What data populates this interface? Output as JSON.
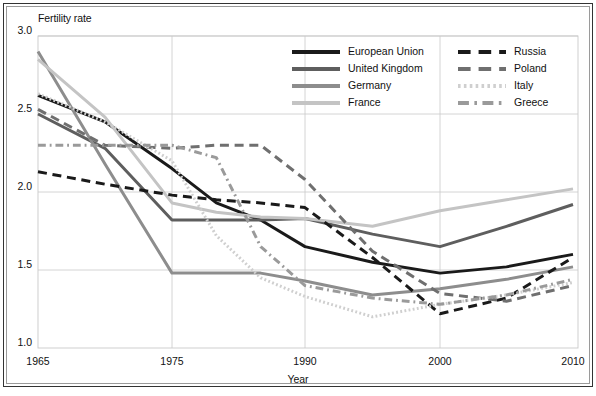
{
  "chart_data": {
    "type": "line",
    "title": "",
    "ylabel": "Fertility rate",
    "xlabel": "Year",
    "x": [
      1965,
      1970,
      1975,
      1980,
      1985,
      1990,
      1995,
      2000,
      2005,
      2010
    ],
    "xticks": [
      1965,
      1975,
      1990,
      2000,
      2010
    ],
    "xticklabels": [
      "1965",
      "1975",
      "1990",
      "2000",
      "2010"
    ],
    "xlim": [
      1965,
      2010
    ],
    "yticks": [
      1.0,
      1.5,
      2.0,
      2.5,
      3.0
    ],
    "yticklabels": [
      "1.0",
      "1.5",
      "2.0",
      "2.5",
      "3.0"
    ],
    "ylim": [
      1.0,
      3.0
    ],
    "grid": true,
    "legend_position": "top-right-inside",
    "series": [
      {
        "name": "European Union",
        "color": "#1a1a1a",
        "style": "solid",
        "width": 3.0,
        "values": [
          2.62,
          2.45,
          2.15,
          1.93,
          1.82,
          1.65,
          1.55,
          1.48,
          1.52,
          1.6
        ]
      },
      {
        "name": "United Kingdom",
        "color": "#5e5e5e",
        "style": "solid",
        "width": 3.0,
        "values": [
          2.5,
          2.28,
          1.82,
          1.82,
          1.82,
          1.83,
          1.73,
          1.65,
          1.78,
          1.92
        ]
      },
      {
        "name": "Germany",
        "color": "#8d8d8d",
        "style": "solid",
        "width": 3.0,
        "values": [
          2.9,
          2.18,
          1.48,
          1.48,
          1.48,
          1.43,
          1.34,
          1.38,
          1.44,
          1.52
        ]
      },
      {
        "name": "France",
        "color": "#c4c4c4",
        "style": "solid",
        "width": 3.0,
        "values": [
          2.85,
          2.48,
          1.93,
          1.87,
          1.84,
          1.83,
          1.78,
          1.88,
          1.95,
          2.02
        ]
      },
      {
        "name": "Russia",
        "color": "#1a1a1a",
        "style": "dashed",
        "width": 3.0,
        "values": [
          2.13,
          2.05,
          1.98,
          1.95,
          1.93,
          1.9,
          1.58,
          1.22,
          1.32,
          1.58
        ]
      },
      {
        "name": "Poland",
        "color": "#6f6f6f",
        "style": "dashed",
        "width": 3.0,
        "values": [
          2.53,
          2.3,
          2.28,
          2.3,
          2.3,
          2.08,
          1.62,
          1.35,
          1.3,
          1.4
        ]
      },
      {
        "name": "Italy",
        "color": "#cfcfcf",
        "style": "dotted",
        "width": 3.0,
        "values": [
          2.63,
          2.45,
          2.2,
          1.72,
          1.45,
          1.33,
          1.2,
          1.28,
          1.34,
          1.42
        ]
      },
      {
        "name": "Greece",
        "color": "#9a9a9a",
        "style": "dashdot",
        "width": 3.0,
        "values": [
          2.3,
          2.3,
          2.3,
          2.22,
          1.65,
          1.4,
          1.32,
          1.28,
          1.34,
          1.44
        ]
      }
    ]
  },
  "legend": {
    "column_left": [
      "European Union",
      "United Kingdom",
      "Germany",
      "France"
    ],
    "column_right": [
      "Russia",
      "Poland",
      "Italy",
      "Greece"
    ]
  }
}
